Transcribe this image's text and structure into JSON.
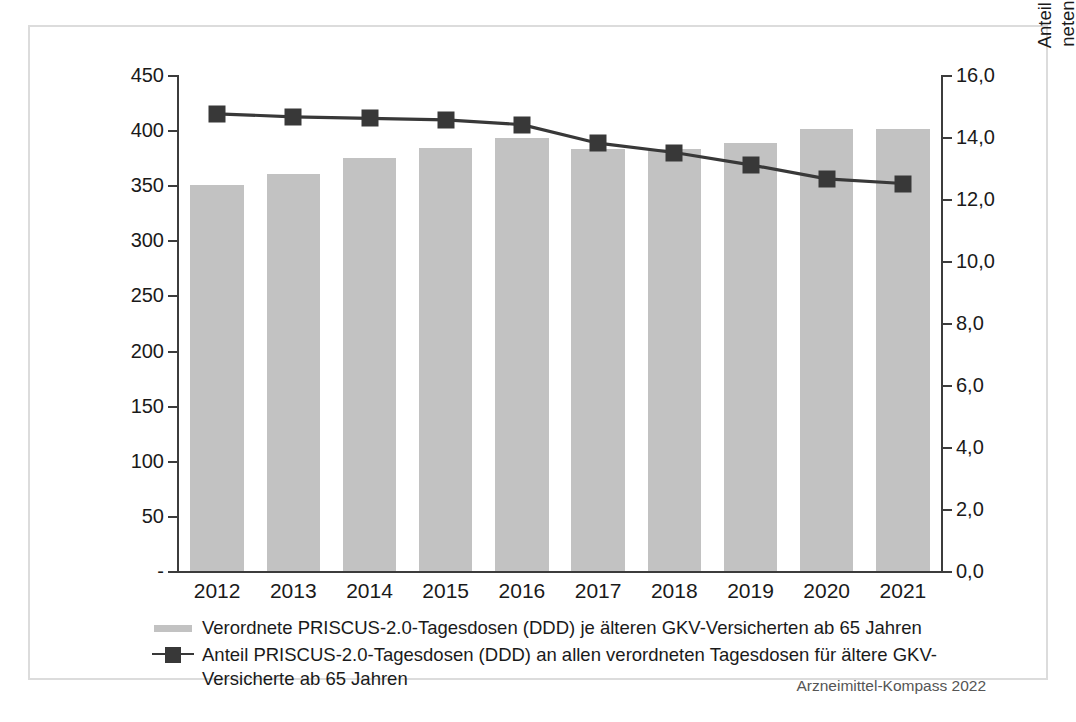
{
  "source_note": "Arzneimittel-Kompass 2022",
  "axes": {
    "left_title": "Verordnete PRISCUS-2.0-Tagesdosen (DDD)\nje älteren GKV-Versicherten",
    "right_title": "Anteil PRISCUS-2.0-Tagesdosen (DDD) an allen verord-\nneten Tagesdosen für ältere GKV-Versicherte in Prozent",
    "left_ticks": [
      "450",
      "400",
      "350",
      "300",
      "250",
      "200",
      "150",
      "100",
      "50",
      "-"
    ],
    "right_ticks": [
      "16,0",
      "14,0",
      "12,0",
      "10,0",
      "8,0",
      "6,0",
      "4,0",
      "2,0",
      "0,0"
    ]
  },
  "legend": {
    "bars_label": "Verordnete PRISCUS-2.0-Tagesdosen (DDD) je älteren GKV-Versicherten ab 65 Jahren",
    "line_label": "Anteil PRISCUS-2.0-Tagesdosen (DDD) an allen verordneten Tagesdosen für ältere GKV-Versicherte ab 65 Jahren"
  },
  "chart_data": {
    "type": "bar",
    "title": "",
    "xlabel": "",
    "categories": [
      "2012",
      "2013",
      "2014",
      "2015",
      "2016",
      "2017",
      "2018",
      "2019",
      "2020",
      "2021"
    ],
    "grid": false,
    "legend_position": "bottom",
    "series": [
      {
        "name": "Verordnete PRISCUS-2.0-Tagesdosen (DDD) je älteren GKV-Versicherten ab 65 Jahren",
        "type": "bar",
        "axis": "left",
        "color": "#c2c2c2",
        "ylabel": "Verordnete PRISCUS-2.0-Tagesdosen (DDD) je älteren GKV-Versicherten",
        "ylim": [
          0,
          450
        ],
        "ytick_step": 50,
        "values": [
          350,
          360,
          375,
          384,
          393,
          383,
          383,
          388,
          401,
          401
        ]
      },
      {
        "name": "Anteil PRISCUS-2.0-Tagesdosen (DDD) an allen verordneten Tagesdosen für ältere GKV-Versicherte ab 65 Jahren",
        "type": "line",
        "axis": "right",
        "color": "#383838",
        "marker": "square",
        "ylabel": "Anteil PRISCUS-2.0-Tagesdosen (DDD) an allen verordneten Tagesdosen für ältere GKV-Versicherte in Prozent",
        "ylim": [
          0,
          16
        ],
        "ytick_step": 2,
        "values": [
          14.75,
          14.65,
          14.6,
          14.55,
          14.4,
          13.8,
          13.5,
          13.1,
          12.65,
          12.5
        ]
      }
    ]
  }
}
